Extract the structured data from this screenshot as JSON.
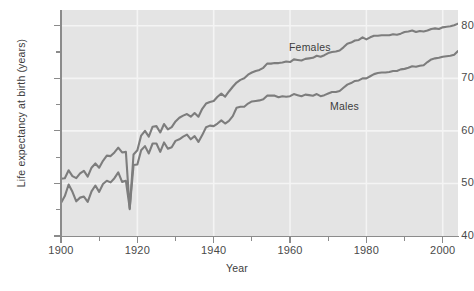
{
  "figure": {
    "background": "#ffffff",
    "plot_background": "#e4e4e4",
    "gridline_color": "#f4f4f4",
    "axis_color": "#8b8b8b",
    "line_color": "#7d7d7d"
  },
  "axis_titles": {
    "y": "Life expectancy at birth (years)",
    "x": "Year"
  },
  "series_labels": {
    "females": "Females",
    "males": "Males"
  },
  "ticks": {
    "y_major": [
      "40",
      "50",
      "60",
      "70",
      "80"
    ],
    "y_minor": [
      "45",
      "55",
      "65",
      "75"
    ],
    "x_major": [
      "1900",
      "1920",
      "1940",
      "1960",
      "1980",
      "2000"
    ],
    "x_minor": [
      "1910",
      "1930",
      "1950",
      "1970",
      "1990"
    ]
  },
  "chart_data": {
    "type": "line",
    "title": "",
    "xlabel": "Year",
    "ylabel": "Life expectancy at birth (years)",
    "xlim": [
      1900,
      2004
    ],
    "ylim": [
      40,
      83
    ],
    "grid": true,
    "legend_position": "inline-annotation",
    "x": [
      1900,
      1901,
      1902,
      1903,
      1904,
      1905,
      1906,
      1907,
      1908,
      1909,
      1910,
      1911,
      1912,
      1913,
      1914,
      1915,
      1916,
      1917,
      1918,
      1919,
      1920,
      1921,
      1922,
      1923,
      1924,
      1925,
      1926,
      1927,
      1928,
      1929,
      1930,
      1931,
      1932,
      1933,
      1934,
      1935,
      1936,
      1937,
      1938,
      1939,
      1940,
      1941,
      1942,
      1943,
      1944,
      1945,
      1946,
      1947,
      1948,
      1949,
      1950,
      1951,
      1952,
      1953,
      1954,
      1955,
      1956,
      1957,
      1958,
      1959,
      1960,
      1961,
      1962,
      1963,
      1964,
      1965,
      1966,
      1967,
      1968,
      1969,
      1970,
      1971,
      1972,
      1973,
      1974,
      1975,
      1976,
      1977,
      1978,
      1979,
      1980,
      1981,
      1982,
      1983,
      1984,
      1985,
      1986,
      1987,
      1988,
      1989,
      1990,
      1991,
      1992,
      1993,
      1994,
      1995,
      1996,
      1997,
      1998,
      1999,
      2000,
      2001,
      2002,
      2003,
      2004
    ],
    "series": [
      {
        "name": "Females",
        "values": [
          50.9,
          51.0,
          52.5,
          51.4,
          51.0,
          51.9,
          52.4,
          51.3,
          53.0,
          53.8,
          53.0,
          54.3,
          55.3,
          55.2,
          55.9,
          56.8,
          55.9,
          56.0,
          45.1,
          55.5,
          56.3,
          59.1,
          60.0,
          58.9,
          60.8,
          60.9,
          59.7,
          61.3,
          60.3,
          60.7,
          61.8,
          62.5,
          62.9,
          63.2,
          62.7,
          63.4,
          62.7,
          64.2,
          65.2,
          65.5,
          65.7,
          66.5,
          67.1,
          66.5,
          67.5,
          68.4,
          69.2,
          69.7,
          70.0,
          70.7,
          71.1,
          71.4,
          71.6,
          72.0,
          72.8,
          72.8,
          72.9,
          72.9,
          73.0,
          73.2,
          73.1,
          73.6,
          73.5,
          73.4,
          73.7,
          73.8,
          73.9,
          74.3,
          74.1,
          74.4,
          74.8,
          75.0,
          75.1,
          75.3,
          75.9,
          76.6,
          76.8,
          77.2,
          77.3,
          77.8,
          77.4,
          77.8,
          78.1,
          78.1,
          78.2,
          78.2,
          78.2,
          78.4,
          78.3,
          78.5,
          78.8,
          78.9,
          79.1,
          78.8,
          79.0,
          78.9,
          79.1,
          79.4,
          79.5,
          79.4,
          79.7,
          79.8,
          79.9,
          80.1,
          80.4
        ]
      },
      {
        "name": "Males",
        "values": [
          46.3,
          47.6,
          49.8,
          48.4,
          46.6,
          47.3,
          47.5,
          46.5,
          48.5,
          49.6,
          48.4,
          49.9,
          50.5,
          50.2,
          51.0,
          52.1,
          50.3,
          50.5,
          45.3,
          53.5,
          53.6,
          56.3,
          57.1,
          55.7,
          57.6,
          57.6,
          56.0,
          57.8,
          56.6,
          56.9,
          58.1,
          58.4,
          58.9,
          59.3,
          58.4,
          59.0,
          57.9,
          59.2,
          60.7,
          61.0,
          60.9,
          61.4,
          62.0,
          61.4,
          61.9,
          62.8,
          64.4,
          64.6,
          64.6,
          65.2,
          65.6,
          65.7,
          65.8,
          66.0,
          66.7,
          66.7,
          66.7,
          66.4,
          66.6,
          66.5,
          66.6,
          67.0,
          66.8,
          66.6,
          66.9,
          66.8,
          66.7,
          67.0,
          66.6,
          66.8,
          67.1,
          67.4,
          67.4,
          67.6,
          68.2,
          68.8,
          69.1,
          69.5,
          69.6,
          70.0,
          70.0,
          70.4,
          70.8,
          71.0,
          71.1,
          71.1,
          71.2,
          71.4,
          71.4,
          71.7,
          71.8,
          72.0,
          72.3,
          72.2,
          72.4,
          72.5,
          73.1,
          73.6,
          73.8,
          73.9,
          74.1,
          74.2,
          74.3,
          74.5,
          75.2
        ]
      }
    ]
  }
}
